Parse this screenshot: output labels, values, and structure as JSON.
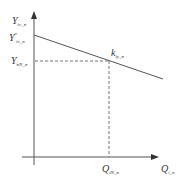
{
  "diagram": {
    "type": "line-graph",
    "colors": {
      "axis": "#555555",
      "line": "#555555",
      "dashed": "#777777",
      "text": "#333333"
    },
    "axes": {
      "y_label": {
        "main": "Y",
        "sub": "iv_n"
      },
      "x_label": {
        "main": "Q",
        "sub": "i_n"
      }
    },
    "y_ticks": [
      {
        "main": "Y",
        "sup": "*",
        "sub": "iv_n"
      },
      {
        "main": "Y",
        "sub": "nN_n"
      }
    ],
    "x_ticks": [
      {
        "main": "Q",
        "sub": "iN_n"
      }
    ],
    "line_annotation": {
      "main": "k",
      "sub": "iy_n"
    },
    "geometry": {
      "origin": [
        34,
        157
      ],
      "y_axis_top": 12,
      "x_axis_right": 158,
      "line_start": [
        34,
        35
      ],
      "line_end": [
        163,
        79
      ],
      "point": [
        109,
        61
      ]
    }
  }
}
